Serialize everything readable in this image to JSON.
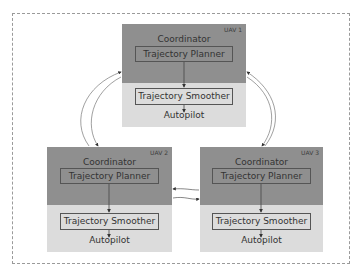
{
  "diagram": {
    "colors": {
      "coordinator_bg": "#8f8f8f",
      "lower_bg": "#dcdcdc",
      "border": "#555555",
      "frame": "#9a9a9a"
    },
    "uavs": [
      {
        "tag": "UAV 1",
        "coordinator": "Coordinator",
        "planner": "Trajectory Planner",
        "smoother": "Trajectory Smoother",
        "autopilot": "Autopilot"
      },
      {
        "tag": "UAV 2",
        "coordinator": "Coordinator",
        "planner": "Trajectory Planner",
        "smoother": "Trajectory Smoother",
        "autopilot": "Autopilot"
      },
      {
        "tag": "UAV 3",
        "coordinator": "Coordinator",
        "planner": "Trajectory Planner",
        "smoother": "Trajectory Smoother",
        "autopilot": "Autopilot"
      }
    ],
    "links": [
      {
        "from": "UAV 1",
        "to": "UAV 2",
        "bidirectional": true
      },
      {
        "from": "UAV 1",
        "to": "UAV 3",
        "bidirectional": true
      },
      {
        "from": "UAV 2",
        "to": "UAV 3",
        "bidirectional": true
      }
    ]
  }
}
